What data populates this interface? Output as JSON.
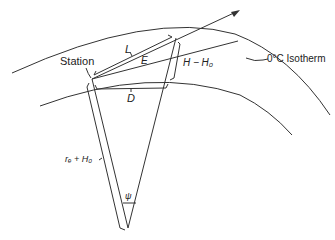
{
  "diagram": {
    "labels": {
      "station": "Station",
      "slant_range": "L",
      "elevation_angle": "E",
      "height_diff": "H − H₀",
      "ground_distance": "D",
      "isotherm": "0°C Isotherm",
      "radius": "rₑ + H₀",
      "central_angle": "ψ"
    }
  }
}
